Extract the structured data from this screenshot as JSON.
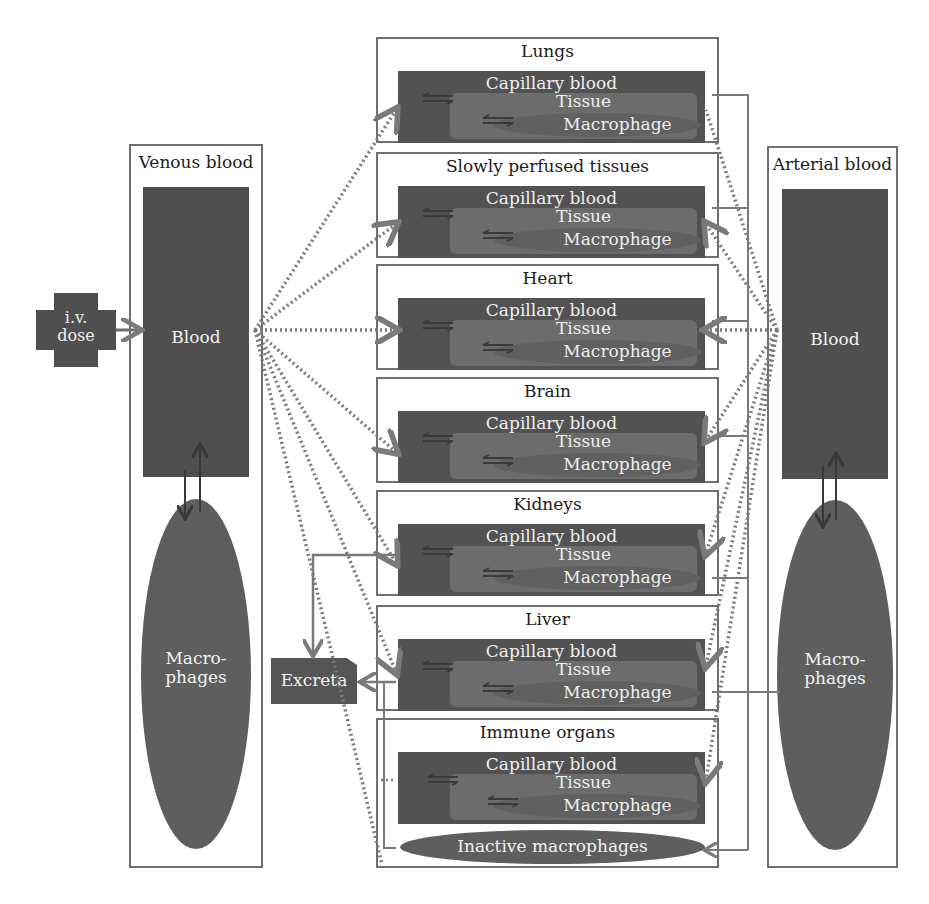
{
  "diagram": {
    "type": "PBPK compartment model",
    "input": {
      "label_line1": "i.v.",
      "label_line2": "dose"
    },
    "venous": {
      "title": "Venous blood",
      "blood_label": "Blood",
      "macrophages_line1": "Macro-",
      "macrophages_line2": "phages"
    },
    "arterial": {
      "title": "Arterial blood",
      "blood_label": "Blood",
      "macrophages_line1": "Macro-",
      "macrophages_line2": "phages"
    },
    "excreta": {
      "label": "Excreta"
    },
    "organs": [
      {
        "name": "Lungs",
        "capillary": "Capillary blood",
        "tissue": "Tissue",
        "macrophage": "Macrophage"
      },
      {
        "name": "Slowly perfused tissues",
        "capillary": "Capillary blood",
        "tissue": "Tissue",
        "macrophage": "Macrophage"
      },
      {
        "name": "Heart",
        "capillary": "Capillary blood",
        "tissue": "Tissue",
        "macrophage": "Macrophage"
      },
      {
        "name": "Brain",
        "capillary": "Capillary blood",
        "tissue": "Tissue",
        "macrophage": "Macrophage"
      },
      {
        "name": "Kidneys",
        "capillary": "Capillary blood",
        "tissue": "Tissue",
        "macrophage": "Macrophage"
      },
      {
        "name": "Liver",
        "capillary": "Capillary blood",
        "tissue": "Tissue",
        "macrophage": "Macrophage"
      },
      {
        "name": "Immune organs",
        "capillary": "Capillary blood",
        "tissue": "Tissue",
        "macrophage": "Macrophage",
        "extra": "Inactive macrophages"
      }
    ],
    "colors": {
      "frame": "#6f6f6f",
      "dark_fill": "#4f4f4f",
      "capillary_fill": "#525252",
      "tissue_fill": "#6c6c6c",
      "macrophage_fill": "#606060",
      "flow_dotted": "#7a7a7a",
      "exchange_arrow": "#3a3a3a"
    }
  }
}
